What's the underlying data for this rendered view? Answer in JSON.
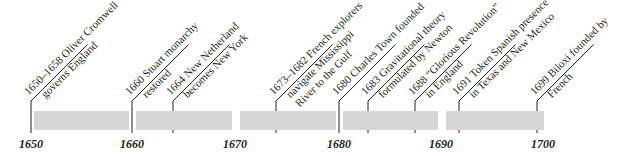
{
  "timeline": {
    "start_year": 1650,
    "end_year": 1700,
    "ticks": [
      {
        "year": 1650,
        "label": "1650",
        "x": 31
      },
      {
        "year": 1660,
        "label": "1660",
        "x": 132
      },
      {
        "year": 1670,
        "label": "1670",
        "x": 235
      },
      {
        "year": 1680,
        "label": "1680",
        "x": 339
      },
      {
        "year": 1690,
        "label": "1690",
        "x": 441
      },
      {
        "year": 1700,
        "label": "1700",
        "x": 543
      }
    ],
    "bar_color": "#d6d6d6",
    "segments": [
      {
        "x": 34,
        "w": 95
      },
      {
        "x": 136,
        "w": 96
      },
      {
        "x": 240,
        "w": 96
      },
      {
        "x": 343,
        "w": 95
      },
      {
        "x": 446,
        "w": 98
      }
    ],
    "events": [
      {
        "x": 31,
        "line1": "1650–1658 Oliver Cromwell",
        "line2": "governs England"
      },
      {
        "x": 132,
        "line1": "1660 Stuart monarchy",
        "line2": "restored"
      },
      {
        "x": 173,
        "line1": "1664 New Netherland",
        "line2": "becomes New York"
      },
      {
        "x": 276,
        "line1": "1673–1682 French explorers",
        "line2": "navigate Mississippi",
        "line3": "River to the Gulf"
      },
      {
        "x": 339,
        "line1": "1680 Charles Town founded",
        "line2": ""
      },
      {
        "x": 368,
        "line1": "1683 Gravitational theory",
        "line2": "formulated by Newton"
      },
      {
        "x": 415,
        "line1": "1688 “Glorious Revolution”",
        "line2": "in England"
      },
      {
        "x": 459,
        "line1": "1691 Token Spanish presence",
        "line2": "in Texas and New Mexico"
      },
      {
        "x": 537,
        "line1": "1699 Biloxi founded by",
        "line2": "French"
      }
    ]
  }
}
